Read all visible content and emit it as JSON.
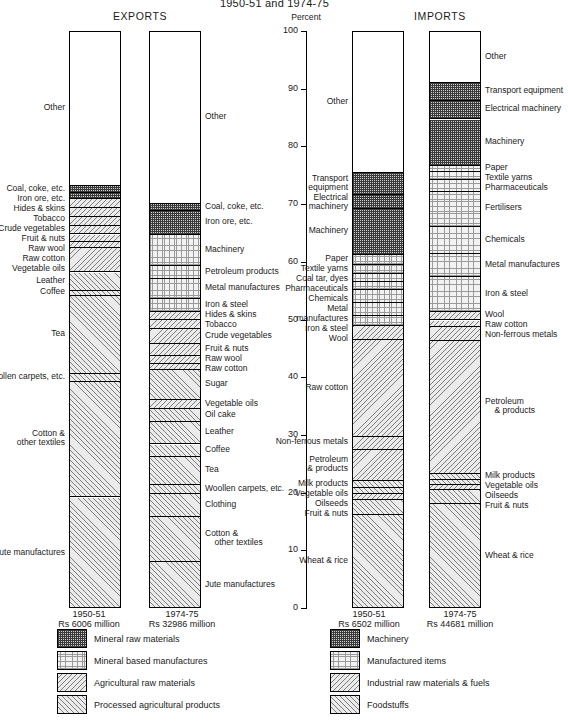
{
  "title": "1950-51 and 1974-75",
  "axis": {
    "unit_label": "Percent",
    "ticks": [
      "100",
      "90",
      "80",
      "70",
      "60",
      "50",
      "40",
      "30",
      "20",
      "10",
      "0"
    ],
    "range": [
      0,
      100
    ]
  },
  "sections": [
    {
      "id": "exports",
      "heading": "EXPORTS"
    },
    {
      "id": "imports",
      "heading": "IMPORTS"
    }
  ],
  "columns": [
    {
      "id": "exports-1950",
      "section": "exports",
      "year": "1950-51",
      "total": "Rs 6006 million",
      "label_side": "left"
    },
    {
      "id": "exports-1974",
      "section": "exports",
      "year": "1974-75",
      "total": "Rs 32986 million",
      "label_side": "right"
    },
    {
      "id": "imports-1950",
      "section": "imports",
      "year": "1950-51",
      "total": "Rs 6502 million",
      "label_side": "left"
    },
    {
      "id": "imports-1974",
      "section": "imports",
      "year": "1974-75",
      "total": "Rs 44681 million",
      "label_side": "right"
    }
  ],
  "legends": [
    {
      "id": "exports-legend",
      "items": [
        {
          "pattern": "p-a",
          "label": "Mineral raw materials"
        },
        {
          "pattern": "p-b",
          "label": "Mineral based manufactures"
        },
        {
          "pattern": "p-c",
          "label": "Agricultural raw materials"
        },
        {
          "pattern": "p-d",
          "label": "Processed agricultural products"
        }
      ]
    },
    {
      "id": "imports-legend",
      "items": [
        {
          "pattern": "p-a",
          "label": "Machinery"
        },
        {
          "pattern": "p-b",
          "label": "Manufactured items"
        },
        {
          "pattern": "p-c",
          "label": "Industrial raw materials & fuels"
        },
        {
          "pattern": "p-d",
          "label": "Foodstuffs"
        }
      ]
    }
  ],
  "chart_data": {
    "type": "bar",
    "subtype": "stacked-100-percent",
    "title": "1950-51 and 1974-75",
    "xlabel": "",
    "ylabel": "Percent",
    "ylim": [
      0,
      100
    ],
    "grid": false,
    "legend_position": "bottom",
    "categories": [
      "EXPORTS 1950-51",
      "EXPORTS 1974-75",
      "IMPORTS 1950-51",
      "IMPORTS 1974-75"
    ],
    "totals": {
      "EXPORTS 1950-51": "Rs 6006 million",
      "EXPORTS 1974-75": "Rs 32986 million",
      "IMPORTS 1950-51": "Rs 6502 million",
      "IMPORTS 1974-75": "Rs 44681 million"
    },
    "series": [
      {
        "name": "EXPORTS 1950-51",
        "stack": [
          {
            "label": "Jute manufactures",
            "value": 19.3,
            "pattern": "p-d"
          },
          {
            "label": "Cotton &\n    other textiles",
            "value": 20.0,
            "pattern": "p-d"
          },
          {
            "label": "Woollen carpets, etc.",
            "value": 1.4,
            "pattern": "p-d"
          },
          {
            "label": "Tea",
            "value": 13.5,
            "pattern": "p-d"
          },
          {
            "label": "Coffee",
            "value": 1.0,
            "pattern": "p-d"
          },
          {
            "label": "Leather",
            "value": 3.1,
            "pattern": "p-d"
          },
          {
            "label": "Vegetable oils",
            "value": 4.2,
            "pattern": "p-c"
          },
          {
            "label": "Raw cotton",
            "value": 1.2,
            "pattern": "p-c"
          },
          {
            "label": "Raw wool",
            "value": 1.2,
            "pattern": "p-c"
          },
          {
            "label": "Fruit & nuts",
            "value": 1.4,
            "pattern": "p-c"
          },
          {
            "label": "Crude vegetables",
            "value": 1.6,
            "pattern": "p-c"
          },
          {
            "label": "Tobacco",
            "value": 1.6,
            "pattern": "p-c"
          },
          {
            "label": "Hides & skins",
            "value": 1.6,
            "pattern": "p-c"
          },
          {
            "label": "Iron ore, etc.",
            "value": 1.0,
            "pattern": "p-a"
          },
          {
            "label": "Coal, coke, etc.",
            "value": 1.2,
            "pattern": "p-a"
          },
          {
            "label": "Other",
            "value": 26.7,
            "pattern": "p-none"
          }
        ]
      },
      {
        "name": "EXPORTS 1974-75",
        "stack": [
          {
            "label": "Jute manufactures",
            "value": 8.1,
            "pattern": "p-d"
          },
          {
            "label": "Cotton &\n    other textiles",
            "value": 7.8,
            "pattern": "p-d"
          },
          {
            "label": "Clothing",
            "value": 4.0,
            "pattern": "p-d"
          },
          {
            "label": "Woollen carpets, etc.",
            "value": 1.6,
            "pattern": "p-d"
          },
          {
            "label": "Tea",
            "value": 5.0,
            "pattern": "p-d"
          },
          {
            "label": "Coffee",
            "value": 2.0,
            "pattern": "p-d"
          },
          {
            "label": "Leather",
            "value": 4.0,
            "pattern": "p-d"
          },
          {
            "label": "Oil cake",
            "value": 2.2,
            "pattern": "p-d"
          },
          {
            "label": "Vegetable oils",
            "value": 1.6,
            "pattern": "p-c"
          },
          {
            "label": "Sugar",
            "value": 5.2,
            "pattern": "p-d"
          },
          {
            "label": "Raw cotton",
            "value": 1.0,
            "pattern": "p-c"
          },
          {
            "label": "Raw wool",
            "value": 1.4,
            "pattern": "p-c"
          },
          {
            "label": "Fruit & nuts",
            "value": 2.0,
            "pattern": "p-c"
          },
          {
            "label": "Crude vegetables",
            "value": 2.6,
            "pattern": "p-c"
          },
          {
            "label": "Tobacco",
            "value": 1.6,
            "pattern": "p-c"
          },
          {
            "label": "Hides & skins",
            "value": 1.4,
            "pattern": "p-c"
          },
          {
            "label": "Iron & steel",
            "value": 2.2,
            "pattern": "p-b"
          },
          {
            "label": "Metal manufactures",
            "value": 3.5,
            "pattern": "p-b"
          },
          {
            "label": "Petroleum products",
            "value": 2.2,
            "pattern": "p-b"
          },
          {
            "label": "Machinery",
            "value": 5.4,
            "pattern": "p-b"
          },
          {
            "label": "Iron ore, etc.",
            "value": 4.2,
            "pattern": "p-a"
          },
          {
            "label": "Coal, coke, etc.",
            "value": 1.2,
            "pattern": "p-a"
          },
          {
            "label": "Other",
            "value": 29.8,
            "pattern": "p-none"
          }
        ]
      },
      {
        "name": "IMPORTS 1950-51",
        "stack": [
          {
            "label": "Wheat & rice",
            "value": 16.3,
            "pattern": "p-d"
          },
          {
            "label": "Fruit & nuts",
            "value": 2.6,
            "pattern": "p-d"
          },
          {
            "label": "Oilseeds",
            "value": 1.0,
            "pattern": "p-c"
          },
          {
            "label": "Vegetable oils",
            "value": 1.0,
            "pattern": "p-d"
          },
          {
            "label": "Milk products",
            "value": 1.2,
            "pattern": "p-d"
          },
          {
            "label": "Petroleum\n    & products",
            "value": 5.4,
            "pattern": "p-c"
          },
          {
            "label": "Non-ferrous metals",
            "value": 2.4,
            "pattern": "p-c"
          },
          {
            "label": "Raw cotton",
            "value": 16.8,
            "pattern": "p-c"
          },
          {
            "label": "Wool",
            "value": 2.4,
            "pattern": "p-c"
          },
          {
            "label": "Iron & steel",
            "value": 1.7,
            "pattern": "p-b"
          },
          {
            "label": "Metal\n    manufactures",
            "value": 2.2,
            "pattern": "p-b"
          },
          {
            "label": "Chemicals",
            "value": 2.2,
            "pattern": "p-b"
          },
          {
            "label": "Pharmaceuticals",
            "value": 1.4,
            "pattern": "p-b"
          },
          {
            "label": "Coal tar, dyes",
            "value": 1.4,
            "pattern": "p-b"
          },
          {
            "label": "Textile yarns",
            "value": 1.6,
            "pattern": "p-b"
          },
          {
            "label": "Paper",
            "value": 1.8,
            "pattern": "p-b"
          },
          {
            "label": "Machinery",
            "value": 8.0,
            "pattern": "p-a"
          },
          {
            "label": "Electrical\n    machinery",
            "value": 2.4,
            "pattern": "p-a"
          },
          {
            "label": "Transport\n    equipment",
            "value": 3.8,
            "pattern": "p-a"
          },
          {
            "label": "Other",
            "value": 24.4,
            "pattern": "p-none"
          }
        ]
      },
      {
        "name": "IMPORTS 1974-75",
        "stack": [
          {
            "label": "Wheat & rice",
            "value": 18.2,
            "pattern": "p-d"
          },
          {
            "label": "Fruit & nuts",
            "value": 2.4,
            "pattern": "p-d"
          },
          {
            "label": "Oilseeds",
            "value": 0.9,
            "pattern": "p-c"
          },
          {
            "label": "Vegetable oils",
            "value": 0.9,
            "pattern": "p-d"
          },
          {
            "label": "Milk products",
            "value": 1.0,
            "pattern": "p-d"
          },
          {
            "label": "Petroleum\n    & products",
            "value": 23.0,
            "pattern": "p-c"
          },
          {
            "label": "Non-ferrous metals",
            "value": 2.6,
            "pattern": "p-c"
          },
          {
            "label": "Raw cotton",
            "value": 1.0,
            "pattern": "p-c"
          },
          {
            "label": "Wool",
            "value": 1.6,
            "pattern": "p-c"
          },
          {
            "label": "Iron & steel",
            "value": 6.0,
            "pattern": "p-b"
          },
          {
            "label": "Metal manufactures",
            "value": 4.0,
            "pattern": "p-b"
          },
          {
            "label": "Chemicals",
            "value": 4.6,
            "pattern": "p-b"
          },
          {
            "label": "Fertilisers",
            "value": 6.2,
            "pattern": "p-b"
          },
          {
            "label": "Pharmaceuticals",
            "value": 2.0,
            "pattern": "p-b"
          },
          {
            "label": "Textile yarns",
            "value": 1.4,
            "pattern": "p-b"
          },
          {
            "label": "Paper",
            "value": 1.0,
            "pattern": "p-b"
          },
          {
            "label": "Machinery",
            "value": 8.0,
            "pattern": "p-a"
          },
          {
            "label": "Electrical machinery",
            "value": 3.2,
            "pattern": "p-a"
          },
          {
            "label": "Transport equipment",
            "value": 3.2,
            "pattern": "p-a"
          },
          {
            "label": "Other",
            "value": 8.8,
            "pattern": "p-none"
          }
        ]
      }
    ]
  }
}
